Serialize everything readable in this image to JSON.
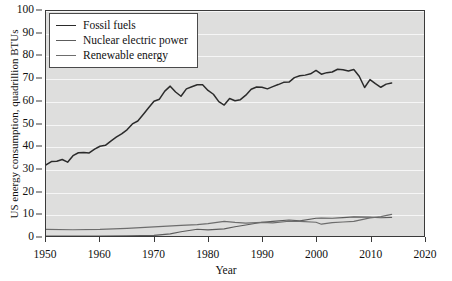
{
  "chart_data": {
    "type": "line",
    "title": "",
    "xlabel": "Year",
    "ylabel": "US energy consumption, quadrillion BTUs",
    "xlim": [
      1950,
      2020
    ],
    "ylim": [
      0,
      100
    ],
    "xticks": [
      1950,
      1960,
      1970,
      1980,
      1990,
      2000,
      2010,
      2020
    ],
    "yticks": [
      0,
      10,
      20,
      30,
      40,
      50,
      60,
      70,
      80,
      90,
      100
    ],
    "grid": "horizontal",
    "legend_position": "upper-left",
    "plot_background": "#dededd",
    "gridline_color": "#f6f6f6",
    "series": [
      {
        "name": "Fossil fuels",
        "color": "#2b2b2b",
        "x": [
          1950,
          1951,
          1952,
          1953,
          1954,
          1955,
          1956,
          1957,
          1958,
          1959,
          1960,
          1961,
          1962,
          1963,
          1964,
          1965,
          1966,
          1967,
          1968,
          1969,
          1970,
          1971,
          1972,
          1973,
          1974,
          1975,
          1976,
          1977,
          1978,
          1979,
          1980,
          1981,
          1982,
          1983,
          1984,
          1985,
          1986,
          1987,
          1988,
          1989,
          1990,
          1991,
          1992,
          1993,
          1994,
          1995,
          1996,
          1997,
          1998,
          1999,
          2000,
          2001,
          2002,
          2003,
          2004,
          2005,
          2006,
          2007,
          2008,
          2009,
          2010,
          2011,
          2012,
          2013,
          2014
        ],
        "y": [
          31.6,
          33.1,
          33.2,
          34.0,
          32.8,
          35.7,
          37.0,
          37.1,
          36.9,
          38.6,
          39.9,
          40.3,
          42.2,
          43.9,
          45.4,
          47.2,
          49.8,
          51.1,
          54.0,
          57.0,
          59.9,
          60.8,
          64.4,
          66.6,
          64.0,
          62.1,
          65.4,
          66.3,
          67.2,
          67.2,
          64.7,
          63.0,
          59.7,
          58.2,
          61.1,
          60.1,
          60.6,
          62.6,
          65.2,
          66.2,
          66.1,
          65.4,
          66.4,
          67.3,
          68.3,
          68.4,
          70.4,
          71.2,
          71.5,
          72.1,
          73.6,
          71.9,
          72.6,
          72.9,
          74.1,
          73.9,
          73.3,
          74.0,
          71.0,
          66.0,
          69.5,
          67.7,
          66.1,
          67.5,
          68.0
        ],
        "y_label_note": "values in quadrillion BTUs; peak ~86 on displayed scale at 2005-2007"
      },
      {
        "name": "Nuclear electric power",
        "color": "#5c5c5c",
        "x": [
          1950,
          1955,
          1957,
          1960,
          1965,
          1970,
          1973,
          1975,
          1978,
          1980,
          1983,
          1985,
          1987,
          1990,
          1992,
          1995,
          1997,
          2000,
          2001,
          2003,
          2005,
          2007,
          2010,
          2012,
          2014
        ],
        "y": [
          0.0,
          0.0,
          0.0,
          0.0,
          0.04,
          0.24,
          0.91,
          1.9,
          3.0,
          2.7,
          3.2,
          4.1,
          4.9,
          6.1,
          6.5,
          7.1,
          6.7,
          7.9,
          8.0,
          7.9,
          8.2,
          8.5,
          8.4,
          8.1,
          8.3
        ]
      },
      {
        "name": "Renewable energy",
        "color": "#6d6d6d",
        "x": [
          1950,
          1955,
          1960,
          1965,
          1970,
          1975,
          1978,
          1980,
          1983,
          1985,
          1987,
          1990,
          1992,
          1995,
          1997,
          2000,
          2001,
          2003,
          2005,
          2007,
          2010,
          2012,
          2014
        ],
        "y": [
          2.98,
          2.78,
          2.93,
          3.4,
          4.08,
          4.72,
          5.04,
          5.49,
          6.5,
          6.03,
          5.69,
          6.04,
          5.8,
          6.56,
          6.52,
          6.1,
          5.24,
          5.93,
          6.23,
          6.52,
          8.09,
          8.6,
          9.6
        ]
      }
    ]
  },
  "axes": {
    "y_title": "US energy consumption, quadrillion BTUs",
    "x_title": "Year",
    "y_tick_labels": [
      "0",
      "10",
      "20",
      "30",
      "40",
      "50",
      "60",
      "70",
      "80",
      "90",
      "100"
    ],
    "x_tick_labels": [
      "1950",
      "1960",
      "1970",
      "1980",
      "1990",
      "2000",
      "2010",
      "2020"
    ]
  },
  "legend": {
    "items": [
      {
        "label": "Fossil fuels",
        "swatch": "line-swatch-fossil"
      },
      {
        "label": "Nuclear electric power",
        "swatch": "line-swatch-nuclear"
      },
      {
        "label": "Renewable energy",
        "swatch": "line-swatch-renewable"
      }
    ]
  }
}
